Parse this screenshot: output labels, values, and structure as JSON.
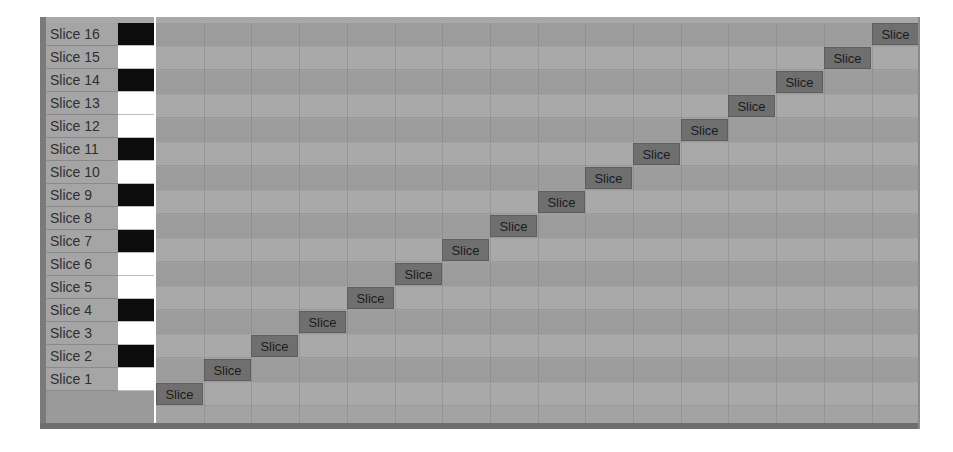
{
  "editor": {
    "rows": [
      {
        "label": "Slice 16",
        "key": "black",
        "clip": "Slice",
        "col": 15
      },
      {
        "label": "Slice 15",
        "key": "white",
        "clip": "Slice",
        "col": 14
      },
      {
        "label": "Slice 14",
        "key": "black",
        "clip": "Slice",
        "col": 13
      },
      {
        "label": "Slice 13",
        "key": "white",
        "clip": "Slice",
        "col": 12
      },
      {
        "label": "Slice 12",
        "key": "white",
        "clip": "Slice",
        "col": 11
      },
      {
        "label": "Slice 11",
        "key": "black",
        "clip": "Slice",
        "col": 10
      },
      {
        "label": "Slice 10",
        "key": "white",
        "clip": "Slice",
        "col": 9
      },
      {
        "label": "Slice 9",
        "key": "black",
        "clip": "Slice",
        "col": 8
      },
      {
        "label": "Slice 8",
        "key": "white",
        "clip": "Slice",
        "col": 7
      },
      {
        "label": "Slice 7",
        "key": "black",
        "clip": "Slice",
        "col": 6
      },
      {
        "label": "Slice 6",
        "key": "white",
        "clip": "Slice",
        "col": 5
      },
      {
        "label": "Slice 5",
        "key": "white",
        "clip": "Slice",
        "col": 4
      },
      {
        "label": "Slice 4",
        "key": "black",
        "clip": "Slice",
        "col": 3
      },
      {
        "label": "Slice 3",
        "key": "white",
        "clip": "Slice",
        "col": 2
      },
      {
        "label": "Slice 2",
        "key": "black",
        "clip": "Slice",
        "col": 1
      },
      {
        "label": "Slice 1",
        "key": "white",
        "clip": "Slice",
        "col": 0
      }
    ],
    "column_width": 47.7,
    "row_height": 23,
    "colors": {
      "grid_dark": "#9c9c9c",
      "grid_light": "#a9a9a9",
      "clip": "#6f6f6f",
      "label_bg": "#a5a5a5"
    }
  }
}
